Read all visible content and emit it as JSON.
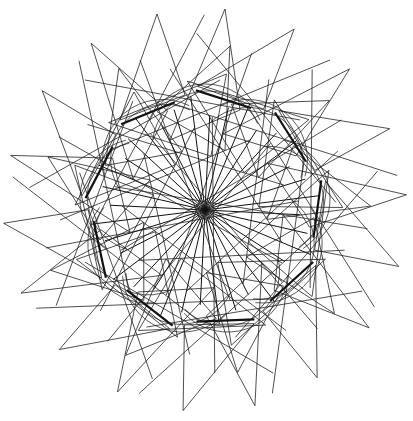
{
  "artwork": {
    "title": "",
    "description": "Generative rotationally symmetric line drawing: radial spokes from a central point, rotated triangle spikes, arcs, and thick chords forming a polygon ring",
    "symmetry_order": 9,
    "stroke_color": "#222222",
    "background_color": "#ffffff",
    "spoke_count": 36
  }
}
